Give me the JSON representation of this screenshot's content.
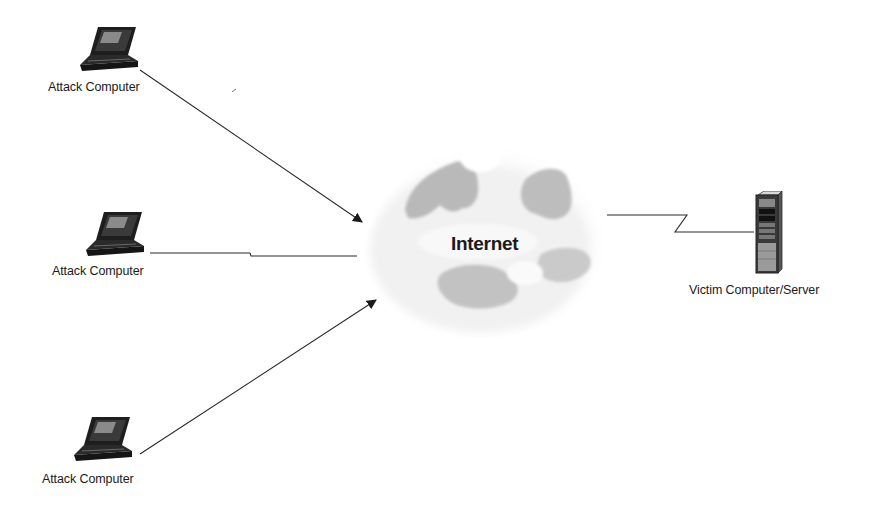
{
  "diagram": {
    "type": "network-topology",
    "nodes": [
      {
        "id": "attacker-1",
        "label": "Attack Computer",
        "icon": "laptop-icon"
      },
      {
        "id": "attacker-2",
        "label": "Attack Computer",
        "icon": "laptop-icon"
      },
      {
        "id": "attacker-3",
        "label": "Attack Computer",
        "icon": "laptop-icon"
      },
      {
        "id": "internet",
        "label": "Internet",
        "icon": "cloud-icon"
      },
      {
        "id": "victim",
        "label": "Victim Computer/Server",
        "icon": "server-tower-icon"
      }
    ],
    "edges": [
      {
        "from": "attacker-1",
        "to": "internet",
        "style": "arrow"
      },
      {
        "from": "attacker-2",
        "to": "internet",
        "style": "lightning-link"
      },
      {
        "from": "attacker-3",
        "to": "internet",
        "style": "arrow"
      },
      {
        "from": "internet",
        "to": "victim",
        "style": "lightning-link"
      }
    ]
  },
  "colors": {
    "line": "#2a2a2a",
    "cloud_dark": "#a8a8a8",
    "cloud_light": "#e6e6e6"
  }
}
